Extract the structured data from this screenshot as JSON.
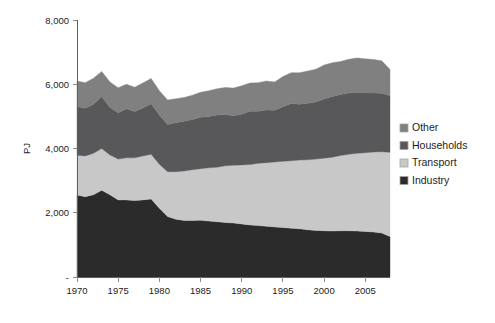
{
  "chart_data": {
    "type": "area",
    "stacked": true,
    "title": "",
    "subtitle": "",
    "xlabel": "",
    "ylabel": "PJ",
    "xlim": [
      1970,
      2008
    ],
    "ylim": [
      0,
      8000
    ],
    "grid": false,
    "legend_position": "right",
    "x": [
      1970,
      1971,
      1972,
      1973,
      1974,
      1975,
      1976,
      1977,
      1978,
      1979,
      1980,
      1981,
      1982,
      1983,
      1984,
      1985,
      1986,
      1987,
      1988,
      1989,
      1990,
      1991,
      1992,
      1993,
      1994,
      1995,
      1996,
      1997,
      1998,
      1999,
      2000,
      2001,
      2002,
      2003,
      2004,
      2005,
      2006,
      2007,
      2008
    ],
    "xtick_labels": [
      "1970",
      "1975",
      "1980",
      "1985",
      "1990",
      "1995",
      "2000",
      "2005"
    ],
    "xtick_values": [
      1970,
      1975,
      1980,
      1985,
      1990,
      1995,
      2000,
      2005
    ],
    "ytick_labels": [
      "-",
      "2,000",
      "4,000",
      "6,000",
      "8,000"
    ],
    "ytick_values": [
      0,
      2000,
      4000,
      6000,
      8000
    ],
    "series": [
      {
        "name": "Industry",
        "color": "#2b2b2b",
        "values": [
          2550,
          2500,
          2560,
          2700,
          2560,
          2400,
          2400,
          2380,
          2400,
          2430,
          2140,
          1880,
          1800,
          1760,
          1760,
          1770,
          1740,
          1720,
          1700,
          1680,
          1650,
          1620,
          1600,
          1580,
          1560,
          1540,
          1520,
          1500,
          1470,
          1450,
          1440,
          1430,
          1440,
          1440,
          1430,
          1420,
          1400,
          1370,
          1260
        ]
      },
      {
        "name": "Transport",
        "color": "#c8c8c8",
        "values": [
          1240,
          1270,
          1290,
          1300,
          1240,
          1270,
          1310,
          1330,
          1370,
          1390,
          1370,
          1400,
          1480,
          1540,
          1580,
          1600,
          1660,
          1700,
          1760,
          1800,
          1840,
          1880,
          1940,
          1980,
          2020,
          2060,
          2100,
          2140,
          2180,
          2220,
          2260,
          2300,
          2340,
          2380,
          2420,
          2450,
          2490,
          2530,
          2620
        ]
      },
      {
        "name": "Households",
        "color": "#58585a",
        "values": [
          1520,
          1480,
          1530,
          1620,
          1480,
          1440,
          1530,
          1440,
          1490,
          1570,
          1530,
          1470,
          1520,
          1550,
          1560,
          1600,
          1600,
          1620,
          1600,
          1540,
          1580,
          1660,
          1620,
          1640,
          1610,
          1700,
          1780,
          1740,
          1760,
          1780,
          1840,
          1890,
          1900,
          1910,
          1900,
          1860,
          1840,
          1820,
          1760
        ]
      },
      {
        "name": "Other",
        "color": "#808080",
        "values": [
          790,
          800,
          810,
          780,
          790,
          780,
          760,
          760,
          780,
          790,
          760,
          760,
          750,
          740,
          760,
          780,
          800,
          820,
          840,
          860,
          880,
          880,
          890,
          900,
          880,
          940,
          960,
          980,
          1000,
          1020,
          1060,
          1050,
          1030,
          1050,
          1070,
          1060,
          1040,
          1010,
          820
        ]
      }
    ],
    "totals": [
      6100,
      6050,
      6190,
      6400,
      6070,
      5890,
      6000,
      5910,
      6040,
      6180,
      5800,
      5510,
      5550,
      5590,
      5660,
      5750,
      5800,
      5860,
      5900,
      5880,
      5950,
      6040,
      6050,
      6100,
      6070,
      6240,
      6360,
      6360,
      6410,
      6470,
      6600,
      6670,
      6710,
      6780,
      6820,
      6790,
      6770,
      6730,
      6460
    ]
  },
  "legend": {
    "items": [
      {
        "label": "Other",
        "color": "#808080"
      },
      {
        "label": "Households",
        "color": "#58585a"
      },
      {
        "label": "Transport",
        "color": "#c8c8c8"
      },
      {
        "label": "Industry",
        "color": "#2b2b2b"
      }
    ]
  },
  "axes": {
    "y_title": "PJ"
  }
}
